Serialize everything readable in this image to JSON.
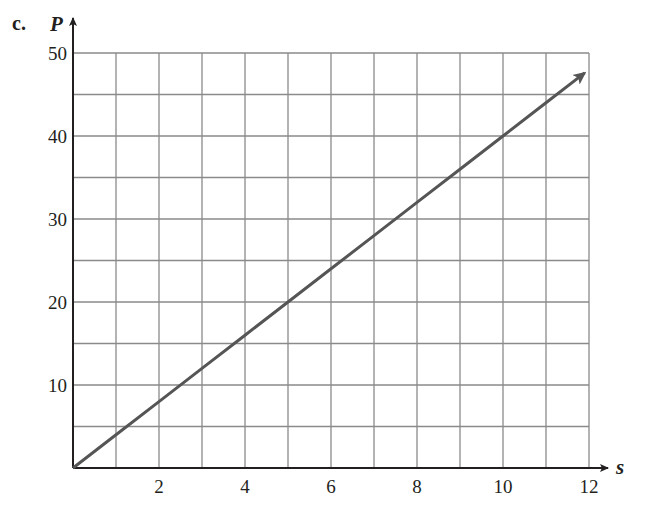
{
  "part_label": "c.",
  "chart_data": {
    "type": "line",
    "title": "",
    "xlabel": "s",
    "ylabel": "P",
    "xlim": [
      0,
      12
    ],
    "ylim": [
      0,
      50
    ],
    "x_ticks": [
      2,
      4,
      6,
      8,
      10,
      12
    ],
    "y_ticks": [
      10,
      20,
      30,
      40,
      50
    ],
    "x_tick_labels": [
      "2",
      "4",
      "6",
      "8",
      "10",
      "12"
    ],
    "y_tick_labels": [
      "10",
      "20",
      "30",
      "40",
      "50"
    ],
    "grid": true,
    "grid_x_step": 1,
    "grid_y_step": 5,
    "legend": null,
    "series": [
      {
        "name": "P = 4s",
        "x": [
          0,
          1,
          2,
          3,
          4,
          5,
          6,
          7,
          8,
          9,
          10,
          11,
          11.9
        ],
        "y": [
          0,
          4,
          8,
          12,
          16,
          20,
          24,
          28,
          32,
          36,
          40,
          44,
          47.6
        ],
        "arrow_end": true,
        "color": "#555555"
      }
    ]
  },
  "colors": {
    "axis": "#231f20",
    "grid": "#8a8a8a",
    "line": "#555555"
  }
}
